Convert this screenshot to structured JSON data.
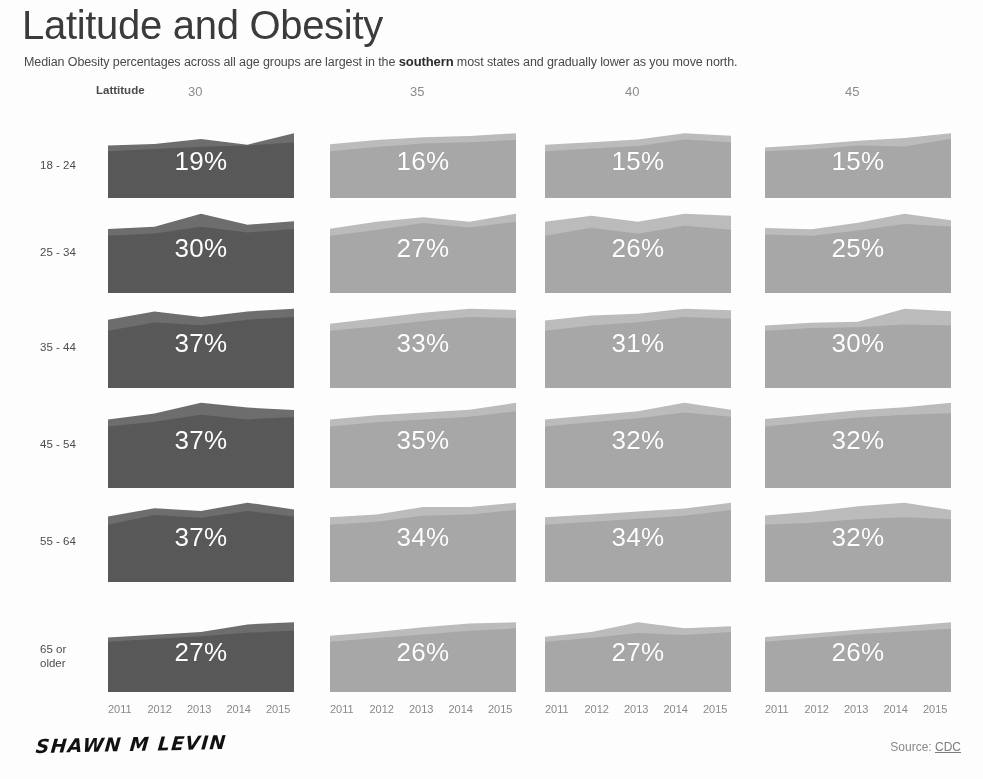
{
  "header": {
    "title": "Latitude and Obesity",
    "subtitle_before": "Median Obesity percentages across all age groups are largest in the ",
    "subtitle_bold": "southern",
    "subtitle_after": " most states and gradually lower as you move north."
  },
  "axis": {
    "latitude_label": "Lattitude",
    "years": [
      "2011",
      "2012",
      "2013",
      "2014",
      "2015"
    ]
  },
  "footer": {
    "signature": "SHAWN M LEVIN",
    "source_label": "Source:",
    "source_link": "CDC"
  },
  "colors": {
    "dark_fill": "#595959",
    "dark_fill_top": "#6e6e6e",
    "light_fill": "#a8a8a8",
    "light_fill_top": "#bdbdbd",
    "label_text": "#ffffff",
    "axis_text": "#8a8a8a",
    "title_text": "#3b3b3b"
  },
  "chart_data": {
    "type": "area",
    "title": "Latitude and Obesity",
    "subtitle": "Median Obesity percentages across all age groups are largest in the southern most states and gradually lower as you move north.",
    "xlabel": "",
    "ylabel": "",
    "grid": false,
    "legend": "none",
    "layout": "small-multiples 6 rows (age group) x 4 columns (latitude)",
    "x": [
      "2011",
      "2012",
      "2013",
      "2014",
      "2015"
    ],
    "row_categories": [
      "18 - 24",
      "25 - 34",
      "35 - 44",
      "45 - 54",
      "55 - 64",
      "65 or older"
    ],
    "column_categories": [
      "30",
      "35",
      "40",
      "45"
    ],
    "column_label": "Lattitude",
    "panels": [
      {
        "row": "18 - 24",
        "column": "30",
        "label": "19%",
        "value": 19,
        "shade": "dark",
        "median_series": [
          17.0,
          17.6,
          18.2,
          18.6,
          19.4
        ],
        "upper_series": [
          18.6,
          19.0,
          20.4,
          18.8,
          22.0
        ]
      },
      {
        "row": "18 - 24",
        "column": "35",
        "label": "16%",
        "value": 16,
        "shade": "light",
        "median_series": [
          14.6,
          15.2,
          15.7,
          15.9,
          16.2
        ],
        "upper_series": [
          15.6,
          16.2,
          16.6,
          16.8,
          17.2
        ]
      },
      {
        "row": "18 - 24",
        "column": "40",
        "label": "15%",
        "value": 15,
        "shade": "light",
        "median_series": [
          13.8,
          14.2,
          14.6,
          15.6,
          15.2
        ],
        "upper_series": [
          14.8,
          15.2,
          15.6,
          16.6,
          16.2
        ]
      },
      {
        "row": "18 - 24",
        "column": "45",
        "label": "15%",
        "value": 15,
        "shade": "light",
        "median_series": [
          13.4,
          13.8,
          14.6,
          14.4,
          16.0
        ],
        "upper_series": [
          14.2,
          14.8,
          15.6,
          16.2,
          17.2
        ]
      },
      {
        "row": "25 - 34",
        "column": "30",
        "label": "30%",
        "value": 30,
        "shade": "dark",
        "median_series": [
          28.4,
          28.8,
          30.0,
          29.0,
          29.6
        ],
        "upper_series": [
          29.6,
          30.0,
          32.4,
          30.4,
          31.0
        ]
      },
      {
        "row": "25 - 34",
        "column": "35",
        "label": "27%",
        "value": 27,
        "shade": "light",
        "median_series": [
          25.4,
          26.4,
          27.6,
          26.8,
          27.8
        ],
        "upper_series": [
          26.6,
          27.8,
          28.6,
          27.8,
          29.2
        ]
      },
      {
        "row": "25 - 34",
        "column": "40",
        "label": "26%",
        "value": 26,
        "shade": "light",
        "median_series": [
          25.2,
          26.0,
          25.4,
          26.2,
          25.8
        ],
        "upper_series": [
          26.6,
          27.2,
          26.6,
          27.4,
          27.2
        ]
      },
      {
        "row": "25 - 34",
        "column": "45",
        "label": "25%",
        "value": 25,
        "shade": "light",
        "median_series": [
          24.2,
          24.0,
          24.8,
          25.8,
          25.4
        ],
        "upper_series": [
          25.2,
          25.0,
          26.0,
          27.4,
          26.4
        ]
      },
      {
        "row": "35 - 44",
        "column": "30",
        "label": "37%",
        "value": 37,
        "shade": "dark",
        "median_series": [
          35.4,
          36.6,
          36.2,
          37.0,
          37.4
        ],
        "upper_series": [
          37.0,
          38.2,
          37.4,
          38.2,
          38.6
        ]
      },
      {
        "row": "35 - 44",
        "column": "35",
        "label": "33%",
        "value": 33,
        "shade": "light",
        "median_series": [
          31.6,
          32.2,
          33.0,
          33.6,
          33.4
        ],
        "upper_series": [
          32.6,
          33.4,
          34.2,
          34.8,
          34.6
        ]
      },
      {
        "row": "35 - 44",
        "column": "40",
        "label": "31%",
        "value": 31,
        "shade": "light",
        "median_series": [
          30.0,
          30.6,
          31.0,
          31.6,
          31.4
        ],
        "upper_series": [
          31.2,
          31.8,
          32.0,
          32.6,
          32.4
        ]
      },
      {
        "row": "35 - 44",
        "column": "45",
        "label": "30%",
        "value": 30,
        "shade": "light",
        "median_series": [
          29.0,
          29.6,
          29.8,
          30.4,
          30.2
        ],
        "upper_series": [
          30.2,
          30.8,
          31.0,
          34.0,
          33.4
        ]
      },
      {
        "row": "45 - 54",
        "column": "30",
        "label": "37%",
        "value": 37,
        "shade": "dark",
        "median_series": [
          35.6,
          36.4,
          37.6,
          36.8,
          37.2
        ],
        "upper_series": [
          36.8,
          37.8,
          39.6,
          38.8,
          38.4
        ]
      },
      {
        "row": "45 - 54",
        "column": "35",
        "label": "35%",
        "value": 35,
        "shade": "light",
        "median_series": [
          33.4,
          34.0,
          34.4,
          34.8,
          35.6
        ],
        "upper_series": [
          34.4,
          35.0,
          35.4,
          35.8,
          36.8
        ]
      },
      {
        "row": "45 - 54",
        "column": "40",
        "label": "32%",
        "value": 32,
        "shade": "light",
        "median_series": [
          31.0,
          31.6,
          32.2,
          33.0,
          32.4
        ],
        "upper_series": [
          32.0,
          32.6,
          33.2,
          34.4,
          33.4
        ]
      },
      {
        "row": "45 - 54",
        "column": "45",
        "label": "32%",
        "value": 32,
        "shade": "light",
        "median_series": [
          30.8,
          31.4,
          32.0,
          32.4,
          32.6
        ],
        "upper_series": [
          31.8,
          32.4,
          33.0,
          33.4,
          34.0
        ]
      },
      {
        "row": "55 - 64",
        "column": "30",
        "label": "37%",
        "value": 37,
        "shade": "dark",
        "median_series": [
          35.6,
          37.0,
          36.6,
          37.6,
          36.8
        ],
        "upper_series": [
          36.8,
          38.0,
          37.6,
          38.8,
          37.8
        ]
      },
      {
        "row": "55 - 64",
        "column": "35",
        "label": "34%",
        "value": 34,
        "shade": "light",
        "median_series": [
          33.0,
          33.4,
          34.2,
          34.4,
          35.0
        ],
        "upper_series": [
          34.0,
          34.4,
          35.4,
          35.4,
          36.0
        ]
      },
      {
        "row": "55 - 64",
        "column": "40",
        "label": "34%",
        "value": 34,
        "shade": "light",
        "median_series": [
          33.0,
          33.4,
          33.8,
          34.2,
          35.0
        ],
        "upper_series": [
          34.0,
          34.4,
          34.8,
          35.2,
          36.0
        ]
      },
      {
        "row": "55 - 64",
        "column": "45",
        "label": "32%",
        "value": 32,
        "shade": "light",
        "median_series": [
          31.6,
          31.8,
          32.2,
          32.4,
          32.2
        ],
        "upper_series": [
          32.6,
          33.0,
          33.6,
          34.0,
          33.2
        ]
      },
      {
        "row": "65 or older",
        "column": "30",
        "label": "27%",
        "value": 27,
        "shade": "dark",
        "median_series": [
          24.6,
          25.4,
          26.2,
          27.2,
          27.8
        ],
        "upper_series": [
          25.8,
          26.6,
          27.4,
          29.6,
          30.2
        ]
      },
      {
        "row": "65 or older",
        "column": "35",
        "label": "26%",
        "value": 26,
        "shade": "light",
        "median_series": [
          24.4,
          25.0,
          25.6,
          26.2,
          26.6
        ],
        "upper_series": [
          25.4,
          26.0,
          26.8,
          27.4,
          27.6
        ]
      },
      {
        "row": "65 or older",
        "column": "40",
        "label": "27%",
        "value": 27,
        "shade": "light",
        "median_series": [
          25.0,
          25.8,
          26.8,
          26.4,
          27.0
        ],
        "upper_series": [
          26.0,
          27.0,
          29.0,
          27.8,
          28.2
        ]
      },
      {
        "row": "65 or older",
        "column": "45",
        "label": "26%",
        "value": 26,
        "shade": "light",
        "median_series": [
          23.8,
          24.6,
          25.4,
          26.0,
          26.6
        ],
        "upper_series": [
          24.8,
          25.6,
          26.4,
          27.2,
          28.0
        ]
      }
    ]
  },
  "geometry": {
    "columns_x": [
      108,
      330,
      545,
      765
    ],
    "column_width": 186,
    "rows_y": [
      131,
      211,
      306,
      400,
      500,
      620
    ],
    "row_heights": [
      67,
      82,
      82,
      88,
      82,
      72
    ],
    "row_label_x": 40
  }
}
